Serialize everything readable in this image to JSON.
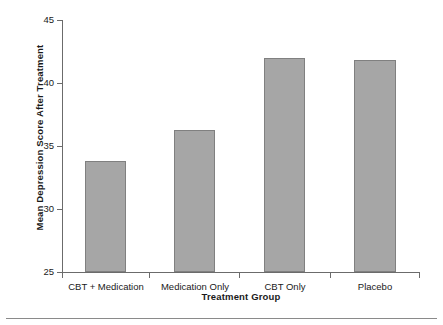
{
  "chart_data": {
    "type": "bar",
    "title": "",
    "xlabel": "Treatment Group",
    "ylabel": "Mean Depression Score After Treatment",
    "categories": [
      "CBT + Medication",
      "Medication Only",
      "CBT Only",
      "Placebo"
    ],
    "values": [
      33.8,
      36.3,
      42.0,
      41.8
    ],
    "ylim": [
      25,
      45
    ],
    "yticks": [
      25,
      30,
      35,
      40,
      45
    ],
    "ytick_labels": [
      "25",
      "30",
      "35",
      "40",
      "45"
    ],
    "grid": false,
    "legend": false,
    "legend_position": "none",
    "bar_color": "#a6a6a6",
    "bar_edge_color": "#808080",
    "axis_color": "#6b6b6b",
    "text_color": "#1a1a1a",
    "background": "#ffffff"
  },
  "figure": {
    "footer_rule_color": "#8a8a8a"
  }
}
